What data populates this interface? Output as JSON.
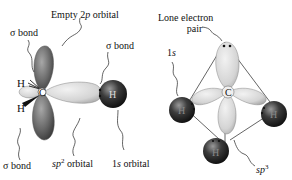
{
  "left_diagram": {
    "title": "sp2 hybridized carbon (carbocation)",
    "labels": {
      "empty_2p_prefix": "Empty 2",
      "empty_2p_italic": "p",
      "empty_2p_suffix": " orbital",
      "sigma_bond_top_left": "σ bond",
      "sigma_bond_top_right": "σ bond",
      "sigma_bond_bottom": "σ bond",
      "sp2_italic": "sp",
      "sp2_sup": "2",
      "sp2_suffix": " orbital",
      "s1_prefix": "1",
      "s1_italic": "s",
      "s1_suffix": " orbital"
    },
    "atoms": {
      "carbon": "C",
      "h_upper": "H",
      "h_lower": "H",
      "h_right": "H"
    }
  },
  "right_diagram": {
    "title": "sp3 hybridized carbon with lone pair",
    "labels": {
      "lone_pair_line1": "Lone electron",
      "lone_pair_line2": "pair",
      "s1_prefix": "1",
      "s1_italic": "s",
      "sp3_italic": "sp",
      "sp3_sup": "3"
    },
    "atoms": {
      "carbon": "C",
      "h_left": "H",
      "h_right": "H",
      "h_bottom": "H"
    }
  },
  "colors": {
    "dark_lobe": "#6e6e6e",
    "light_lobe": "#d9d9d9",
    "h_atom": "#2a2a2a",
    "line": "#222222"
  }
}
